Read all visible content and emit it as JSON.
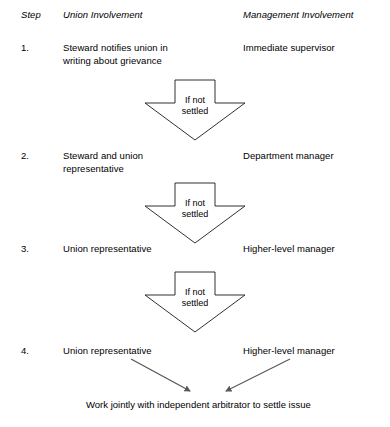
{
  "diagram": {
    "headers": {
      "step": "Step",
      "union": "Union Involvement",
      "management": "Management Involvement"
    },
    "steps": [
      {
        "number": "1.",
        "union": "Steward notifies union in\nwriting about grievance",
        "management": "Immediate supervisor"
      },
      {
        "number": "2.",
        "union": "Steward and union\nrepresentative",
        "management": "Department manager"
      },
      {
        "number": "3.",
        "union": "Union representative",
        "management": "Higher-level manager"
      },
      {
        "number": "4.",
        "union": "Union representative",
        "management": "Higher-level manager"
      }
    ],
    "connectors": [
      {
        "label": "If not\nsettled"
      },
      {
        "label": "If not\nsettled"
      },
      {
        "label": "If not\nsettled"
      }
    ],
    "outcome": "Work jointly with independent arbitrator to settle issue",
    "colors": {
      "text": "#000000",
      "arrow_stroke": "#1a1a1a",
      "arrow_fill": "#ffffff",
      "converge_arrow": "#58585a",
      "background": "#ffffff"
    }
  }
}
